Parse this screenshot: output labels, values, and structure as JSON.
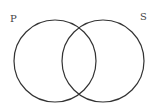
{
  "diagram": {
    "type": "venn",
    "sets": [
      {
        "label": "P",
        "cx": 55,
        "cy": 61,
        "r": 42
      },
      {
        "label": "S",
        "cx": 103,
        "cy": 61,
        "r": 42
      }
    ],
    "stroke_color": "#333333"
  }
}
